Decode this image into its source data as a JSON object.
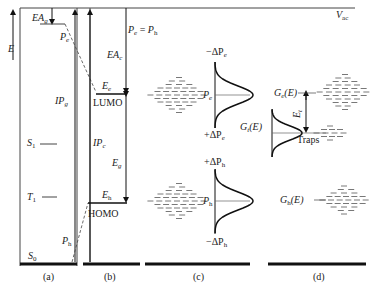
{
  "figure": {
    "vac_label": "V",
    "vac_sub": "ac",
    "energy_axis": "E",
    "panels": [
      {
        "id": "a",
        "caption": "(a)"
      },
      {
        "id": "b",
        "caption": "(b)"
      },
      {
        "id": "c",
        "caption": "(c)"
      },
      {
        "id": "d",
        "caption": "(d)"
      }
    ],
    "panel_a": {
      "ea_g": {
        "main": "EA",
        "sub": "g"
      },
      "ip_g": {
        "main": "IP",
        "sub": "g"
      },
      "p_e": {
        "main": "P",
        "sub": "e"
      },
      "p_h": {
        "main": "P",
        "sub": "h"
      },
      "s1": {
        "main": "S",
        "sub": "1"
      },
      "t1": {
        "main": "T",
        "sub": "1"
      },
      "s0": {
        "main": "S",
        "sub": "0"
      }
    },
    "panel_b": {
      "ea_c": {
        "main": "EA",
        "sub": "c"
      },
      "ip_c": {
        "main": "IP",
        "sub": "c"
      },
      "e_e": {
        "main": "E",
        "sub": "e"
      },
      "e_h": {
        "main": "E",
        "sub": "h"
      },
      "e_g": {
        "main": "E",
        "sub": "g"
      },
      "lumo": "LUMO",
      "homo": "HOMO",
      "pe_eq_ph": {
        "a": "P",
        "a_sub": "e",
        "eq": " = ",
        "b": "P",
        "b_sub": "h"
      }
    },
    "panel_c": {
      "minus_dpe": {
        "pre": "−ΔP",
        "sub": "e"
      },
      "plus_dpe": {
        "pre": "+ΔP",
        "sub": "e"
      },
      "pe": {
        "main": "P",
        "sub": "e"
      },
      "plus_dph": {
        "pre": "+ΔP",
        "sub": "h"
      },
      "minus_dph": {
        "pre": "−ΔP",
        "sub": "h"
      },
      "ph": {
        "main": "P",
        "sub": "h"
      }
    },
    "panel_d": {
      "ge": {
        "main": "G",
        "sub": "e",
        "tail": "(E)"
      },
      "gt": {
        "main": "G",
        "sub": "t",
        "tail": "(E)"
      },
      "gh": {
        "main": "G",
        "sub": "h",
        "tail": "(E)"
      },
      "et": {
        "main": "E",
        "sub": "t"
      },
      "traps": "Traps"
    }
  }
}
